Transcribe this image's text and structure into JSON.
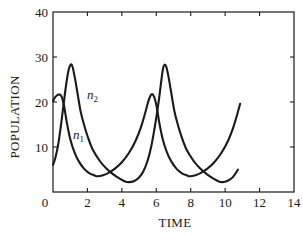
{
  "chart_data": {
    "type": "line",
    "title": "",
    "xlabel": "TIME",
    "ylabel": "POPULATION",
    "xlim": [
      0,
      14
    ],
    "ylim": [
      0,
      40
    ],
    "grid": false,
    "legend": "none (inline curve labels)",
    "x_ticks": [
      0,
      2,
      4,
      6,
      8,
      10,
      12,
      14
    ],
    "x_tick_labels": [
      "0",
      "2",
      "4",
      "6",
      "8",
      "10",
      "12",
      "14"
    ],
    "y_ticks": [
      10,
      20,
      30,
      40
    ],
    "y_tick_labels": [
      "10",
      "20",
      "30",
      "40"
    ],
    "line_color": "#1a1a1a",
    "series": [
      {
        "name": "n1",
        "label_symbol": "n",
        "label_subscript": "1",
        "label_position": {
          "t": 1.16,
          "v": 11.8
        },
        "points": [
          [
            0,
            20.2
          ],
          [
            0.15,
            21.2
          ],
          [
            0.35,
            21.7
          ],
          [
            0.5,
            21.2
          ],
          [
            0.65,
            19.0
          ],
          [
            0.8,
            15.5
          ],
          [
            1.0,
            11.8
          ],
          [
            1.25,
            8.8
          ],
          [
            1.5,
            6.8
          ],
          [
            1.8,
            5.2
          ],
          [
            2.1,
            4.2
          ],
          [
            2.4,
            3.7
          ],
          [
            2.6,
            3.5
          ],
          [
            2.9,
            3.7
          ],
          [
            3.2,
            4.2
          ],
          [
            3.6,
            5.2
          ],
          [
            4.0,
            6.6
          ],
          [
            4.4,
            8.6
          ],
          [
            4.8,
            11.4
          ],
          [
            5.1,
            14.3
          ],
          [
            5.35,
            17.5
          ],
          [
            5.55,
            20.3
          ],
          [
            5.72,
            21.7
          ],
          [
            5.87,
            21.2
          ],
          [
            6.02,
            19.0
          ],
          [
            6.17,
            15.5
          ],
          [
            6.37,
            11.8
          ],
          [
            6.62,
            8.8
          ],
          [
            6.87,
            6.8
          ],
          [
            7.17,
            5.2
          ],
          [
            7.47,
            4.2
          ],
          [
            7.77,
            3.7
          ],
          [
            7.97,
            3.5
          ],
          [
            8.27,
            3.7
          ],
          [
            8.57,
            4.2
          ],
          [
            8.97,
            5.2
          ],
          [
            9.37,
            6.6
          ],
          [
            9.77,
            8.6
          ],
          [
            10.17,
            11.4
          ],
          [
            10.47,
            14.3
          ],
          [
            10.72,
            17.5
          ],
          [
            10.87,
            19.6
          ]
        ]
      },
      {
        "name": "n2",
        "label_symbol": "n",
        "label_subscript": "2",
        "label_position": {
          "t": 1.98,
          "v": 20.7
        },
        "points": [
          [
            0,
            6.0
          ],
          [
            0.15,
            7.8
          ],
          [
            0.3,
            10.5
          ],
          [
            0.45,
            14.5
          ],
          [
            0.6,
            19.0
          ],
          [
            0.75,
            23.5
          ],
          [
            0.9,
            27.0
          ],
          [
            1.02,
            28.3
          ],
          [
            1.12,
            28.0
          ],
          [
            1.25,
            25.8
          ],
          [
            1.4,
            22.5
          ],
          [
            1.6,
            18.0
          ],
          [
            1.8,
            15.0
          ],
          [
            2.0,
            12.5
          ],
          [
            2.3,
            9.5
          ],
          [
            2.7,
            7.0
          ],
          [
            3.1,
            5.2
          ],
          [
            3.5,
            3.9
          ],
          [
            3.9,
            2.9
          ],
          [
            4.15,
            2.4
          ],
          [
            4.4,
            2.2
          ],
          [
            4.7,
            2.4
          ],
          [
            5.0,
            3.2
          ],
          [
            5.25,
            4.6
          ],
          [
            5.5,
            7.0
          ],
          [
            5.7,
            10.0
          ],
          [
            5.87,
            13.5
          ],
          [
            6.02,
            17.0
          ],
          [
            6.17,
            21.0
          ],
          [
            6.3,
            25.0
          ],
          [
            6.4,
            27.6
          ],
          [
            6.48,
            28.3
          ],
          [
            6.58,
            27.8
          ],
          [
            6.7,
            25.8
          ],
          [
            6.85,
            22.5
          ],
          [
            7.05,
            18.0
          ],
          [
            7.25,
            15.0
          ],
          [
            7.45,
            12.5
          ],
          [
            7.75,
            9.5
          ],
          [
            8.15,
            7.0
          ],
          [
            8.55,
            5.2
          ],
          [
            8.95,
            3.9
          ],
          [
            9.35,
            2.9
          ],
          [
            9.6,
            2.4
          ],
          [
            9.85,
            2.2
          ],
          [
            10.15,
            2.5
          ],
          [
            10.45,
            3.3
          ],
          [
            10.75,
            5.0
          ]
        ]
      }
    ]
  }
}
